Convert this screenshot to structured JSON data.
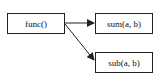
{
  "diagram": {
    "nodes": [
      {
        "id": "func",
        "label": "func()"
      },
      {
        "id": "sum",
        "label": "sum(a, b)"
      },
      {
        "id": "sub",
        "label": "sub(a, b)"
      }
    ],
    "edges": [
      {
        "from": "func",
        "to": "sum"
      },
      {
        "from": "func",
        "to": "sub"
      }
    ],
    "colors": {
      "stroke": "#222222",
      "background": "#ffffff"
    }
  }
}
